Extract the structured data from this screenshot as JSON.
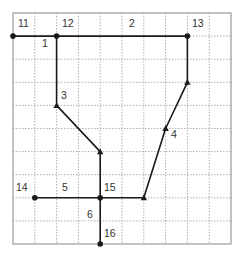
{
  "grid": {
    "cols": 10,
    "rows": 10,
    "origin": [
      13,
      13
    ],
    "cell_w": 21.8,
    "cell_h": 23.1,
    "border_color": "#9a9a9a",
    "line_color": "#9a9a9a"
  },
  "colors": {
    "edge": "#1a1a1a",
    "label": "#333333"
  },
  "nodes": [
    {
      "id": "11",
      "col": 0,
      "row": 1,
      "marker": "dot",
      "label": "11",
      "label_pos": [
        18,
        27
      ]
    },
    {
      "id": "12",
      "col": 2,
      "row": 1,
      "marker": "dot",
      "label": "12",
      "label_pos": [
        62,
        27
      ]
    },
    {
      "id": "13",
      "col": 8,
      "row": 1,
      "marker": "dot",
      "label": "13",
      "label_pos": [
        192,
        27
      ]
    },
    {
      "id": "b1",
      "col": 8,
      "row": 3,
      "marker": "triangle",
      "label": ""
    },
    {
      "id": "b2",
      "col": 7,
      "row": 5,
      "marker": "triangle",
      "label": ""
    },
    {
      "id": "b3",
      "col": 6,
      "row": 8,
      "marker": "triangle",
      "label": ""
    },
    {
      "id": "b4",
      "col": 2,
      "row": 4,
      "marker": "triangle",
      "label": ""
    },
    {
      "id": "b5",
      "col": 4,
      "row": 6,
      "marker": "triangle",
      "label": ""
    },
    {
      "id": "14",
      "col": 1,
      "row": 8,
      "marker": "dot",
      "label": "14",
      "label_pos": [
        16,
        191
      ]
    },
    {
      "id": "15",
      "col": 4,
      "row": 8,
      "marker": "dot",
      "label": "15",
      "label_pos": [
        104,
        191
      ]
    },
    {
      "id": "16",
      "col": 4,
      "row": 10,
      "marker": "dot",
      "label": "16",
      "label_pos": [
        104,
        237
      ]
    }
  ],
  "edges": [
    {
      "id": "1",
      "from": "11",
      "to": "12",
      "label": "1",
      "label_pos": [
        42,
        47
      ]
    },
    {
      "id": "2",
      "from": "12",
      "to": "13",
      "label": "2",
      "label_pos": [
        129,
        27
      ]
    },
    {
      "id": "3a",
      "from": "12",
      "to": "b4",
      "label": "3",
      "label_pos": [
        61,
        99
      ]
    },
    {
      "id": "3b",
      "from": "b4",
      "to": "b5",
      "label": ""
    },
    {
      "id": "3c",
      "from": "b5",
      "to": "15",
      "label": ""
    },
    {
      "id": "4a",
      "from": "13",
      "to": "b1",
      "label": ""
    },
    {
      "id": "4b",
      "from": "b1",
      "to": "b2",
      "label": "4",
      "label_pos": [
        171,
        138
      ]
    },
    {
      "id": "4c",
      "from": "b2",
      "to": "b3",
      "label": ""
    },
    {
      "id": "5a",
      "from": "14",
      "to": "15",
      "label": "5",
      "label_pos": [
        62,
        191
      ]
    },
    {
      "id": "5b",
      "from": "15",
      "to": "b3",
      "label": ""
    },
    {
      "id": "6",
      "from": "15",
      "to": "16",
      "label": "6",
      "label_pos": [
        87,
        218
      ]
    }
  ]
}
